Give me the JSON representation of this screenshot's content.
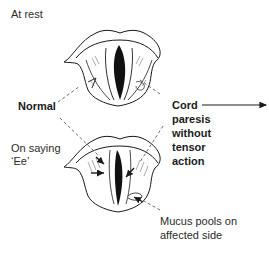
{
  "diagram": {
    "labels": {
      "at_rest": "At rest",
      "normal": "Normal",
      "on_saying_line1": "On saying",
      "on_saying_line2": "‘Ee’",
      "cord_line1": "Cord",
      "cord_line2": "paresis",
      "cord_line3": "without",
      "cord_line4": "tensor",
      "cord_line5": "action",
      "mucus_line1": "Mucus pools on",
      "mucus_line2": "affected side"
    },
    "figures": [
      {
        "name": "larynx-at-rest",
        "state": "glottis open"
      },
      {
        "name": "larynx-phonation",
        "state": "glottis partially closed, arrows showing cord adduction"
      }
    ],
    "colors": {
      "ink": "#1a1a1a",
      "text": "#2a2a2a",
      "background": "#ffffff"
    }
  }
}
